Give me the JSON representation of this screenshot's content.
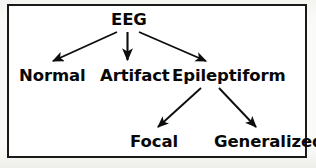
{
  "figure": {
    "type": "hierarchy-tree-diagram",
    "border_color": "#1a1a1a",
    "text_color": "#080808",
    "background_color": "#ffffff",
    "nodes": {
      "root": "EEG",
      "normal": "Normal",
      "artifact": "Artifact",
      "epileptiform": "Epileptiform",
      "focal": "Focal",
      "generalized": "Generalized"
    },
    "edges": [
      {
        "from": "EEG",
        "to": "Normal",
        "style": "arrow"
      },
      {
        "from": "EEG",
        "to": "Artifact",
        "style": "arrow"
      },
      {
        "from": "EEG",
        "to": "Epileptiform",
        "style": "arrow"
      },
      {
        "from": "Epileptiform",
        "to": "Focal",
        "style": "arrow"
      },
      {
        "from": "Epileptiform",
        "to": "Generalized",
        "style": "arrow"
      }
    ]
  }
}
